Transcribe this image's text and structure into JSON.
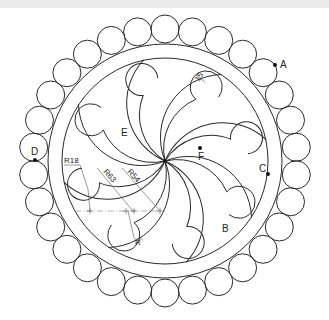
{
  "drawing": {
    "center": [
      165,
      161
    ],
    "outer_ring_radius": 117,
    "inner_ring_radius": 103,
    "bead_orbit_radius": 132,
    "bead_radius": 14,
    "bead_count": 30,
    "blade_count": 8,
    "stroke_color": "#2a2a2a"
  },
  "points": {
    "A": {
      "label": "A",
      "x": 275,
      "y": 65,
      "lx": 280,
      "ly": 68
    },
    "B": {
      "label": "B",
      "x": 226,
      "y": 228,
      "lx": 222,
      "ly": 232
    },
    "C": {
      "label": "C",
      "x": 268,
      "y": 174,
      "lx": 259,
      "ly": 172
    },
    "D": {
      "label": "D",
      "x": 35,
      "y": 160,
      "lx": 31,
      "ly": 155
    },
    "E": {
      "label": "E",
      "x": 126,
      "y": 132,
      "lx": 121,
      "ly": 136
    },
    "F": {
      "label": "F",
      "x": 200,
      "y": 148,
      "lx": 198,
      "ly": 160
    }
  },
  "dimensions": {
    "ring_gap": "15",
    "r18": "R18",
    "r63": "R63",
    "r54": "R54",
    "r": "R"
  }
}
